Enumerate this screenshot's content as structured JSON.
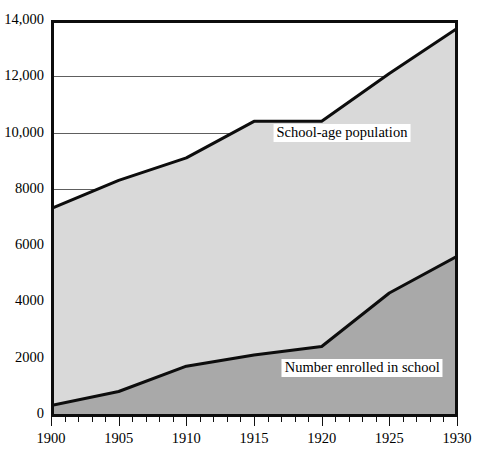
{
  "chart_data": {
    "type": "area",
    "title": "",
    "subtitle": "",
    "xlabel": "",
    "ylabel": "",
    "stacked": false,
    "grid": true,
    "legend_position": "inline-annotations",
    "xlim": [
      1900,
      1930
    ],
    "ylim": [
      0,
      14000
    ],
    "x": [
      1900,
      1905,
      1910,
      1915,
      1920,
      1925,
      1930
    ],
    "ytick_labels": [
      "0",
      "2000",
      "4000",
      "6000",
      "8000",
      "10,000",
      "12,000",
      "14,000"
    ],
    "ytick_values": [
      0,
      2000,
      4000,
      6000,
      8000,
      10000,
      12000,
      14000
    ],
    "xtick_labels": [
      "1900",
      "1905",
      "1910",
      "1915",
      "1920",
      "1925",
      "1930"
    ],
    "xtick_values": [
      1900,
      1905,
      1910,
      1915,
      1920,
      1925,
      1930
    ],
    "x_minor_tick_interval": 1,
    "series": [
      {
        "name": "School-age population",
        "values": [
          7300,
          8300,
          9100,
          10400,
          10400,
          12100,
          13700
        ],
        "fill": "#d9d9d9",
        "line": "#0d0d0d"
      },
      {
        "name": "Number enrolled in school",
        "values": [
          300,
          800,
          1700,
          2100,
          2400,
          4300,
          5600
        ],
        "fill": "#a9a9a9",
        "line": "#0d0d0d"
      }
    ],
    "annotations": [
      {
        "text": "School-age population",
        "x": 1921.5,
        "y": 10000
      },
      {
        "text": "Number enrolled in school",
        "x": 1923.0,
        "y": 1650
      }
    ]
  },
  "colors": {
    "upper_fill": "#d9d9d9",
    "lower_fill": "#a9a9a9",
    "line": "#0d0d0d",
    "gridline": "#5e5e5e",
    "background": "#ffffff"
  }
}
